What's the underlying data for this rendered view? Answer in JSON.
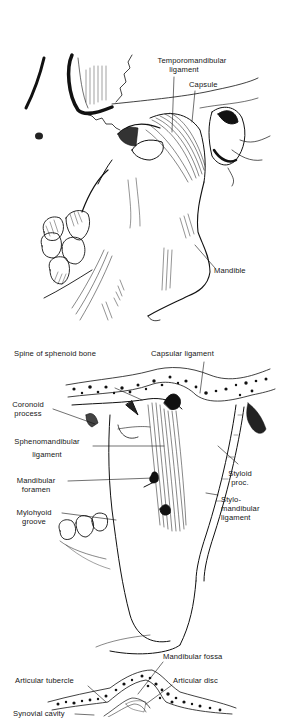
{
  "figure": {
    "panels": [
      {
        "id": "lateral-view",
        "labels": {
          "temporomandibular_ligament_1": "Temporomandibular",
          "temporomandibular_ligament_2": "ligament",
          "capsule": "Capsule",
          "mandible": "Mandible"
        }
      },
      {
        "id": "medial-view",
        "labels": {
          "spine_sphenoid": "Spine of sphenoid bone",
          "capsular_ligament": "Capsular ligament",
          "coronoid_1": "Coronoid",
          "coronoid_2": "process",
          "sphenomandibular_1": "Sphenomandibular",
          "sphenomandibular_2": "ligament",
          "mandibular_foramen_1": "Mandibular",
          "mandibular_foramen_2": "foramen",
          "mylohyoid_1": "Mylohyoid",
          "mylohyoid_2": "groove",
          "styloid_1": "Styloid",
          "styloid_2": "proc.",
          "stylomandibular_1": "Stylo-",
          "stylomandibular_2": "mandibular",
          "stylomandibular_3": "ligament"
        }
      },
      {
        "id": "sagittal-section",
        "labels": {
          "mandibular_fossa": "Mandibular fossa",
          "articular_tubercle": "Articular tubercle",
          "articular_disc": "Articular disc",
          "synovial_cavity": "Synovial cavity"
        }
      }
    ]
  }
}
